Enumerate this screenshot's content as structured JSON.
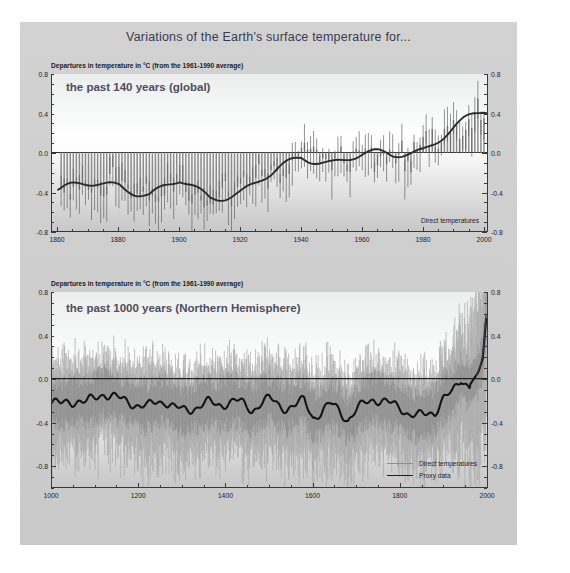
{
  "slide": {
    "title": "Variations of the Earth's surface temperature for...",
    "background_color": "#cfcfcf",
    "page_color": "#ffffff"
  },
  "charts": [
    {
      "id": "past-140-years",
      "axis_caption": "Departures in temperature in °C (from the 1961-1990 average)",
      "inner_title": "the past 140 years (global)",
      "note": "Direct temperatures",
      "ytick_labels": [
        "0.8",
        "0.4",
        "0.0",
        "-0.4",
        "-0.8"
      ],
      "xtick_labels": [
        "1860",
        "1880",
        "1900",
        "1920",
        "1940",
        "1960",
        "1980",
        "2000"
      ]
    },
    {
      "id": "past-1000-years",
      "axis_caption": "Departures in temperature in °C (from the 1961-1990 average)",
      "inner_title": "the past 1000 years (Northern Hemisphere)",
      "ytick_labels": [
        "0.8",
        "0.4",
        "0.0",
        "-0.4",
        "-0.8"
      ],
      "xtick_labels": [
        "1000",
        "1200",
        "1400",
        "1600",
        "1800",
        "2000"
      ],
      "legend": [
        {
          "label": "Direct temperatures",
          "color": "#8e8e8e"
        },
        {
          "label": "Proxy data",
          "color": "#1f1f1f"
        }
      ]
    }
  ],
  "chart_data": [
    {
      "type": "line",
      "id": "past-140-years",
      "title": "the past 140 years (global)",
      "subtitle": "Departures in temperature in °C (from the 1961-1990 average)",
      "xlabel": "",
      "ylabel": "Departures in temperature in °C",
      "xlim": [
        1858,
        2001
      ],
      "ylim": [
        -0.8,
        0.8
      ],
      "xticks": [
        1860,
        1880,
        1900,
        1920,
        1940,
        1960,
        1980,
        2000
      ],
      "yticks": [
        -0.8,
        -0.4,
        0.0,
        0.4,
        0.8
      ],
      "grid": false,
      "legend_position": "inside-bottom-right",
      "annotations": [
        "Direct temperatures"
      ],
      "zero_line": 0.0,
      "series": [
        {
          "name": "Annual mean (bars with uncertainty whiskers)",
          "type": "bar-with-error",
          "color": "#8a8a8a",
          "x": [
            1861,
            1862,
            1863,
            1864,
            1865,
            1866,
            1867,
            1868,
            1869,
            1870,
            1871,
            1872,
            1873,
            1874,
            1875,
            1876,
            1877,
            1878,
            1879,
            1880,
            1881,
            1882,
            1883,
            1884,
            1885,
            1886,
            1887,
            1888,
            1889,
            1890,
            1891,
            1892,
            1893,
            1894,
            1895,
            1896,
            1897,
            1898,
            1899,
            1900,
            1901,
            1902,
            1903,
            1904,
            1905,
            1906,
            1907,
            1908,
            1909,
            1910,
            1911,
            1912,
            1913,
            1914,
            1915,
            1916,
            1917,
            1918,
            1919,
            1920,
            1921,
            1922,
            1923,
            1924,
            1925,
            1926,
            1927,
            1928,
            1929,
            1930,
            1931,
            1932,
            1933,
            1934,
            1935,
            1936,
            1937,
            1938,
            1939,
            1940,
            1941,
            1942,
            1943,
            1944,
            1945,
            1946,
            1947,
            1948,
            1949,
            1950,
            1951,
            1952,
            1953,
            1954,
            1955,
            1956,
            1957,
            1958,
            1959,
            1960,
            1961,
            1962,
            1963,
            1964,
            1965,
            1966,
            1967,
            1968,
            1969,
            1970,
            1971,
            1972,
            1973,
            1974,
            1975,
            1976,
            1977,
            1978,
            1979,
            1980,
            1981,
            1982,
            1983,
            1984,
            1985,
            1986,
            1987,
            1988,
            1989,
            1990,
            1991,
            1992,
            1993,
            1994,
            1995,
            1996,
            1997,
            1998,
            1999,
            2000
          ],
          "values": [
            -0.38,
            -0.41,
            -0.32,
            -0.48,
            -0.35,
            -0.33,
            -0.38,
            -0.32,
            -0.35,
            -0.38,
            -0.41,
            -0.33,
            -0.36,
            -0.44,
            -0.45,
            -0.43,
            -0.22,
            -0.15,
            -0.31,
            -0.31,
            -0.29,
            -0.31,
            -0.37,
            -0.47,
            -0.45,
            -0.42,
            -0.45,
            -0.4,
            -0.32,
            -0.49,
            -0.44,
            -0.5,
            -0.5,
            -0.45,
            -0.44,
            -0.31,
            -0.3,
            -0.4,
            -0.31,
            -0.3,
            -0.32,
            -0.4,
            -0.49,
            -0.52,
            -0.43,
            -0.41,
            -0.49,
            -0.56,
            -0.54,
            -0.52,
            -0.53,
            -0.49,
            -0.46,
            -0.36,
            -0.29,
            -0.45,
            -0.55,
            -0.43,
            -0.35,
            -0.32,
            -0.25,
            -0.33,
            -0.31,
            -0.32,
            -0.26,
            -0.12,
            -0.24,
            -0.25,
            -0.37,
            -0.18,
            -0.14,
            -0.19,
            -0.31,
            -0.24,
            -0.26,
            -0.22,
            -0.08,
            -0.04,
            -0.04,
            0.05,
            0.1,
            0.03,
            0.04,
            0.06,
            0.03,
            -0.1,
            -0.06,
            -0.07,
            -0.09,
            -0.18,
            -0.06,
            0.01,
            0.06,
            -0.11,
            -0.19,
            -0.2,
            0.01,
            0.04,
            0.02,
            -0.03,
            0.04,
            0.02,
            0.05,
            -0.2,
            -0.13,
            -0.04,
            -0.02,
            -0.12,
            0.03,
            0.01,
            -0.11,
            -0.02,
            0.12,
            -0.19,
            -0.09,
            -0.2,
            0.11,
            0.02,
            0.08,
            0.16,
            0.22,
            0.06,
            0.24,
            0.06,
            0.04,
            0.1,
            0.24,
            0.27,
            0.2,
            0.33,
            0.29,
            0.14,
            0.17,
            0.23,
            0.34,
            0.25,
            0.41,
            0.55,
            0.33,
            0.35
          ]
        },
        {
          "name": "Smoothed trend (filtered)",
          "type": "line",
          "color": "#2b2b2b",
          "x": [
            1861,
            1870,
            1880,
            1890,
            1900,
            1910,
            1920,
            1930,
            1940,
            1950,
            1960,
            1970,
            1980,
            1990,
            2000
          ],
          "values": [
            -0.38,
            -0.35,
            -0.31,
            -0.42,
            -0.32,
            -0.45,
            -0.38,
            -0.25,
            -0.05,
            -0.07,
            -0.04,
            -0.04,
            0.06,
            0.24,
            0.4
          ]
        }
      ]
    },
    {
      "type": "line",
      "id": "past-1000-years",
      "title": "the past 1000 years (Northern Hemisphere)",
      "subtitle": "Departures in temperature in °C (from the 1961-1990 average)",
      "xlabel": "",
      "ylabel": "Departures in temperature in °C",
      "xlim": [
        1000,
        2000
      ],
      "ylim": [
        -1.0,
        0.8
      ],
      "xticks": [
        1000,
        1200,
        1400,
        1600,
        1800,
        2000
      ],
      "yticks": [
        -0.8,
        -0.4,
        0.0,
        0.4,
        0.8
      ],
      "grid": false,
      "legend_position": "inside-bottom-right",
      "zero_line": 0.0,
      "series": [
        {
          "name": "Direct temperatures",
          "type": "noise-band",
          "color": "#a9a9a9",
          "description": "grey uncertainty / annual resolution envelope, approx ±0.45°C about the proxy mean"
        },
        {
          "name": "Proxy data",
          "type": "line",
          "color": "#1f1f1f",
          "x": [
            1000,
            1020,
            1040,
            1060,
            1080,
            1100,
            1120,
            1140,
            1160,
            1180,
            1200,
            1220,
            1240,
            1260,
            1280,
            1300,
            1320,
            1340,
            1360,
            1380,
            1400,
            1420,
            1440,
            1460,
            1480,
            1500,
            1520,
            1540,
            1560,
            1580,
            1600,
            1620,
            1640,
            1660,
            1680,
            1700,
            1720,
            1740,
            1760,
            1780,
            1800,
            1820,
            1840,
            1860,
            1880,
            1900,
            1920,
            1940,
            1960,
            1980,
            1990,
            1998
          ],
          "values": [
            -0.22,
            -0.24,
            -0.21,
            -0.2,
            -0.22,
            -0.18,
            -0.13,
            -0.16,
            -0.2,
            -0.22,
            -0.24,
            -0.26,
            -0.22,
            -0.2,
            -0.26,
            -0.3,
            -0.28,
            -0.24,
            -0.22,
            -0.25,
            -0.22,
            -0.2,
            -0.24,
            -0.29,
            -0.22,
            -0.19,
            -0.24,
            -0.27,
            -0.25,
            -0.2,
            -0.35,
            -0.31,
            -0.24,
            -0.28,
            -0.38,
            -0.3,
            -0.22,
            -0.18,
            -0.21,
            -0.24,
            -0.26,
            -0.32,
            -0.35,
            -0.33,
            -0.3,
            -0.18,
            -0.14,
            0.0,
            -0.06,
            0.06,
            0.18,
            0.55
          ]
        }
      ]
    }
  ]
}
